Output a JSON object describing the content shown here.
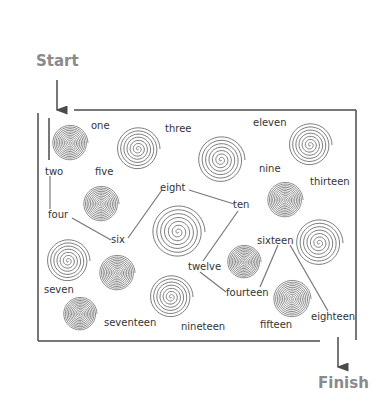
{
  "diagram": {
    "type": "number-word maze",
    "start_label": "Start",
    "finish_label": "Finish",
    "colors": {
      "line": "#4a4a4a",
      "spiral": "#6e6e6e",
      "heading": "#8a8a8a",
      "text": "#333333"
    },
    "words": [
      {
        "id": "one",
        "text": "one",
        "x": 91,
        "y": 121
      },
      {
        "id": "two",
        "text": "two",
        "x": 45,
        "y": 167
      },
      {
        "id": "three",
        "text": "three",
        "x": 165,
        "y": 124
      },
      {
        "id": "four",
        "text": "four",
        "x": 48,
        "y": 210
      },
      {
        "id": "five",
        "text": "five",
        "x": 95,
        "y": 167
      },
      {
        "id": "six",
        "text": "six",
        "x": 111,
        "y": 235
      },
      {
        "id": "seven",
        "text": "seven",
        "x": 44,
        "y": 285
      },
      {
        "id": "eight",
        "text": "eight",
        "x": 160,
        "y": 183
      },
      {
        "id": "nine",
        "text": "nine",
        "x": 259,
        "y": 164
      },
      {
        "id": "ten",
        "text": "ten",
        "x": 233,
        "y": 200
      },
      {
        "id": "eleven",
        "text": "eleven",
        "x": 253,
        "y": 118
      },
      {
        "id": "twelve",
        "text": "twelve",
        "x": 188,
        "y": 262
      },
      {
        "id": "thirteen",
        "text": "thirteen",
        "x": 310,
        "y": 177
      },
      {
        "id": "fourteen",
        "text": "fourteen",
        "x": 226,
        "y": 288
      },
      {
        "id": "fifteen",
        "text": "fifteen",
        "x": 260,
        "y": 320
      },
      {
        "id": "sixteen",
        "text": "sixteen",
        "x": 257,
        "y": 236
      },
      {
        "id": "seventeen",
        "text": "seventeen",
        "x": 104,
        "y": 318
      },
      {
        "id": "eighteen",
        "text": "eighteen",
        "x": 311,
        "y": 312
      },
      {
        "id": "nineteen",
        "text": "nineteen",
        "x": 181,
        "y": 322
      }
    ],
    "path_segments": [
      [
        "two",
        "four"
      ],
      [
        "four",
        "six"
      ],
      [
        "six",
        "eight"
      ],
      [
        "eight",
        "ten"
      ],
      [
        "ten",
        "twelve"
      ],
      [
        "twelve",
        "fourteen"
      ],
      [
        "fourteen",
        "sixteen"
      ],
      [
        "sixteen",
        "eighteen"
      ]
    ],
    "spirals": [
      {
        "cx": 70,
        "cy": 143,
        "r": 18,
        "dense": true
      },
      {
        "cx": 138,
        "cy": 149,
        "r": 22,
        "dense": false
      },
      {
        "cx": 221,
        "cy": 160,
        "r": 24,
        "dense": false
      },
      {
        "cx": 310,
        "cy": 145,
        "r": 22,
        "dense": false
      },
      {
        "cx": 101,
        "cy": 204,
        "r": 18,
        "dense": true
      },
      {
        "cx": 178,
        "cy": 232,
        "r": 27,
        "dense": false
      },
      {
        "cx": 285,
        "cy": 200,
        "r": 18,
        "dense": true
      },
      {
        "cx": 68,
        "cy": 261,
        "r": 22,
        "dense": false
      },
      {
        "cx": 117,
        "cy": 273,
        "r": 18,
        "dense": true
      },
      {
        "cx": 244,
        "cy": 262,
        "r": 17,
        "dense": true
      },
      {
        "cx": 319,
        "cy": 243,
        "r": 24,
        "dense": false
      },
      {
        "cx": 80,
        "cy": 314,
        "r": 17,
        "dense": true
      },
      {
        "cx": 171,
        "cy": 297,
        "r": 22,
        "dense": false
      },
      {
        "cx": 292,
        "cy": 299,
        "r": 19,
        "dense": true
      }
    ]
  }
}
